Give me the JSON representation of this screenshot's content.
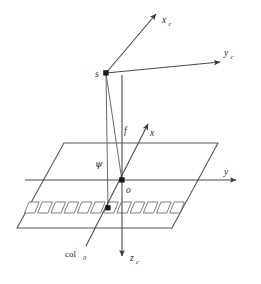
{
  "figure": {
    "background_color": "#ffffff",
    "line_color": "#585858",
    "label_color": "#2b2b2b",
    "caption": ""
  },
  "labels": {
    "axis_xc": "x",
    "axis_xc_sub": "c",
    "axis_yc": "y",
    "axis_yc_sub": "c",
    "axis_zc": "z",
    "axis_zc_sub": "c",
    "axis_x": "x",
    "axis_y": "y",
    "perspective_center": "s",
    "origin": "o",
    "focal_length": "f",
    "angle_psi": "ψ",
    "detector_array": "col",
    "detector_array_sub": "0"
  },
  "geometry": {
    "perspective_center_point": {
      "x": 106,
      "y": 73
    },
    "origin_point": {
      "x": 122,
      "y": 180
    },
    "detector_point": {
      "x": 108,
      "y": 208
    },
    "image_plane_corners": [
      {
        "x": 64,
        "y": 143
      },
      {
        "x": 218,
        "y": 143
      },
      {
        "x": 172,
        "y": 228
      },
      {
        "x": 17,
        "y": 228
      }
    ],
    "detector_cell_count": 12,
    "detector_cell_width": 11.2,
    "detector_cell_height": 11,
    "detector_cell_skew": 4.5,
    "detector_row_start": {
      "x": 29,
      "y": 202
    },
    "axes": {
      "xc": {
        "from": {
          "x": 106,
          "y": 73
        },
        "to": {
          "x": 155,
          "y": 13
        }
      },
      "yc": {
        "from": {
          "x": 106,
          "y": 73
        },
        "to": {
          "x": 221,
          "y": 62
        }
      },
      "zc": {
        "from": {
          "x": 122,
          "y": 75
        },
        "to": {
          "x": 122,
          "y": 258
        }
      },
      "x": {
        "from": {
          "x": 86,
          "y": 246
        },
        "to": {
          "x": 147,
          "y": 125
        }
      },
      "y": {
        "from": {
          "x": 25,
          "y": 180
        },
        "to": {
          "x": 237,
          "y": 180
        }
      }
    },
    "rays": [
      {
        "name": "ray-s-to-detector",
        "from": {
          "x": 106,
          "y": 73
        },
        "to": {
          "x": 108,
          "y": 208
        }
      },
      {
        "name": "ray-s-to-origin",
        "from": {
          "x": 106,
          "y": 73
        },
        "to": {
          "x": 122,
          "y": 180
        }
      }
    ]
  }
}
